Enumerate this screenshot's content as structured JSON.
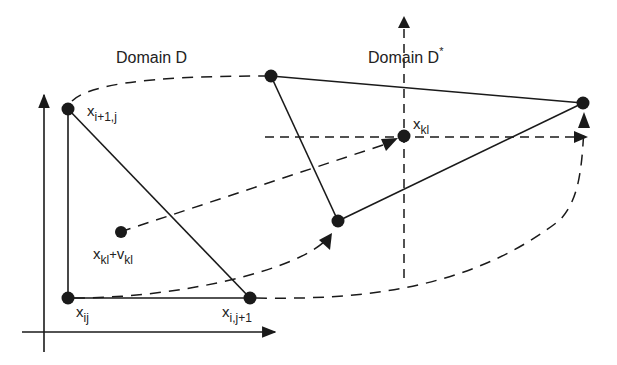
{
  "titles": {
    "domain_d": "Domain D",
    "domain_d_star": "Domain D",
    "domain_d_star_sup": "*"
  },
  "labels": {
    "x_ip1_j": {
      "base": "x",
      "sub": "i+1,j"
    },
    "x_ij": {
      "base": "x",
      "sub": "ij"
    },
    "x_i_jp1": {
      "base": "x",
      "sub": "i,j+1"
    },
    "x_kl": {
      "base": "x",
      "sub": "kl"
    },
    "x_kl_plus_v_kl": {
      "base1": "x",
      "sub1": "kl",
      "op": "+",
      "base2": "v",
      "sub2": "kl"
    }
  },
  "colors": {
    "ink": "#1a1a1a",
    "background": "#ffffff"
  }
}
